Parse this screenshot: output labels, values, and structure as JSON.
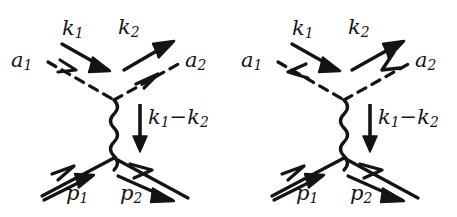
{
  "figure": {
    "type": "feynman-diagram-pair",
    "background_color": "#ffffff",
    "ink_color": "#141414",
    "caption": ""
  },
  "diagrams": [
    {
      "id": "left",
      "name": "t-channel-compton-diagram-a",
      "vertices": [
        {
          "name": "photon-vertex",
          "x": 114,
          "y": 100
        },
        {
          "name": "fermion-vertex",
          "x": 114,
          "y": 158
        }
      ],
      "legs": [
        {
          "name": "incoming-photon-a1",
          "style": "dashed",
          "label": "a",
          "sub": "1",
          "momentum_label": "k",
          "momentum_sub": "1",
          "arrow_direction": "into-vertex"
        },
        {
          "name": "outgoing-photon-a2",
          "style": "dashed",
          "label": "a",
          "sub": "2",
          "momentum_label": "k",
          "momentum_sub": "2",
          "arrow_direction": "out-of-vertex"
        },
        {
          "name": "propagator",
          "style": "wavy",
          "momentum_label": "k",
          "momentum_sub": "1",
          "arrow_direction": "downward"
        },
        {
          "name": "incoming-fermion-p1",
          "style": "solid",
          "label": "p",
          "sub": "1",
          "arrow_direction": "into-vertex"
        },
        {
          "name": "outgoing-fermion-p2",
          "style": "solid",
          "label": "p",
          "sub": "2",
          "arrow_direction": "out-of-vertex"
        }
      ],
      "labels": {
        "k1": {
          "base": "k",
          "sub": "1"
        },
        "k2": {
          "base": "k",
          "sub": "2"
        },
        "a1": {
          "base": "a",
          "sub": "1"
        },
        "a2": {
          "base": "a",
          "sub": "2"
        },
        "q_base1": {
          "base": "k",
          "sub": "1"
        },
        "q_operator": "−",
        "q_base2": {
          "base": "k",
          "sub": "2"
        },
        "p1": {
          "base": "p",
          "sub": "1"
        },
        "p2": {
          "base": "p",
          "sub": "2"
        }
      }
    },
    {
      "id": "right",
      "name": "t-channel-compton-diagram-b",
      "vertices": [
        {
          "name": "photon-vertex",
          "x": 114,
          "y": 100
        },
        {
          "name": "fermion-vertex",
          "x": 114,
          "y": 158
        }
      ],
      "legs": [
        {
          "name": "incoming-photon-a1",
          "style": "dashed",
          "label": "a",
          "sub": "1",
          "momentum_label": "k",
          "momentum_sub": "1",
          "arrow_direction": "out-of-vertex"
        },
        {
          "name": "outgoing-photon-a2",
          "style": "dashed",
          "label": "a",
          "sub": "2",
          "momentum_label": "k",
          "momentum_sub": "2",
          "arrow_direction": "into-vertex"
        },
        {
          "name": "propagator",
          "style": "wavy",
          "momentum_label": "k",
          "momentum_sub": "1",
          "arrow_direction": "downward"
        },
        {
          "name": "incoming-fermion-p1",
          "style": "solid",
          "label": "p",
          "sub": "1",
          "arrow_direction": "into-vertex"
        },
        {
          "name": "outgoing-fermion-p2",
          "style": "solid",
          "label": "p",
          "sub": "2",
          "arrow_direction": "out-of-vertex"
        }
      ],
      "labels": {
        "k1": {
          "base": "k",
          "sub": "1"
        },
        "k2": {
          "base": "k",
          "sub": "2"
        },
        "a1": {
          "base": "a",
          "sub": "1"
        },
        "a2": {
          "base": "a",
          "sub": "2"
        },
        "q_base1": {
          "base": "k",
          "sub": "1"
        },
        "q_operator": "−",
        "q_base2": {
          "base": "k",
          "sub": "2"
        },
        "p1": {
          "base": "p",
          "sub": "1"
        },
        "p2": {
          "base": "p",
          "sub": "2"
        }
      }
    }
  ]
}
